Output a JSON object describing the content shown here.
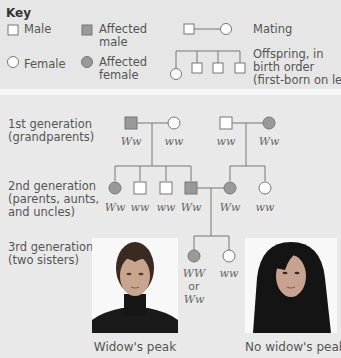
{
  "key": {
    "title": "Key",
    "male": "Male",
    "female": "Female",
    "affected_male": [
      "Affected",
      "male"
    ],
    "affected_female": [
      "Affected",
      "female"
    ],
    "mating": "Mating",
    "offspring": [
      "Offspring, in",
      "birth order",
      "(first-born on left)"
    ]
  },
  "colors": {
    "affected_fill": "#999999",
    "unaffected_fill": "#ffffff",
    "line": "#666666",
    "background": "#e9e9e9"
  },
  "generations": [
    {
      "label": "1st generation\n(grandparents)"
    },
    {
      "label": "2nd generation\n(parents, aunts,\nand uncles)"
    },
    {
      "label": "3rd generation\n(two sisters)"
    }
  ],
  "pedigree": {
    "gen1": [
      {
        "sex": "male",
        "affected": true,
        "genotype": "Ww"
      },
      {
        "sex": "female",
        "affected": false,
        "genotype": "ww"
      },
      {
        "sex": "male",
        "affected": false,
        "genotype": "ww"
      },
      {
        "sex": "female",
        "affected": true,
        "genotype": "Ww"
      }
    ],
    "gen2": [
      {
        "sex": "female",
        "affected": true,
        "genotype": "Ww"
      },
      {
        "sex": "male",
        "affected": false,
        "genotype": "ww"
      },
      {
        "sex": "male",
        "affected": false,
        "genotype": "ww"
      },
      {
        "sex": "male",
        "affected": true,
        "genotype": "Ww"
      },
      {
        "sex": "female",
        "affected": true,
        "genotype": "Ww"
      },
      {
        "sex": "female",
        "affected": false,
        "genotype": "ww"
      }
    ],
    "gen3": [
      {
        "sex": "female",
        "affected": true,
        "genotype_lines": [
          "WW",
          "or",
          "Ww"
        ]
      },
      {
        "sex": "female",
        "affected": false,
        "genotype": "ww"
      }
    ]
  },
  "photos": {
    "left_caption": "Widow's peak",
    "right_caption": "No widow's peak"
  }
}
